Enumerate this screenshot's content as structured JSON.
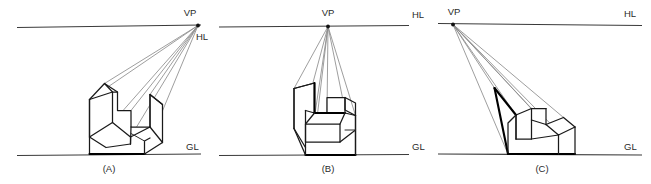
{
  "figure": {
    "background_color": "#ffffff",
    "line_color": "#1a1a1a",
    "ray_color": "#8c8c8c",
    "reference_line_color": "#3a3a3a",
    "panel_count": 3
  },
  "panels": [
    {
      "id": "A",
      "caption": "(A)",
      "vanishing_point_label": "VP",
      "horizon_line_label": "HL",
      "ground_line_label": "GL",
      "vp_position": "right",
      "description": "one-point perspective of stepped block with vanishing point at right end of horizon line"
    },
    {
      "id": "B",
      "caption": "(B)",
      "vanishing_point_label": "VP",
      "horizon_line_label": "HL",
      "ground_line_label": "GL",
      "vp_position": "center",
      "description": "one-point perspective of stepped block with vanishing point centered above object"
    },
    {
      "id": "C",
      "caption": "(C)",
      "vanishing_point_label": "VP",
      "horizon_line_label": "HL",
      "ground_line_label": "GL",
      "vp_position": "left",
      "description": "one-point perspective of stepped block with vanishing point at left end of horizon line"
    }
  ]
}
